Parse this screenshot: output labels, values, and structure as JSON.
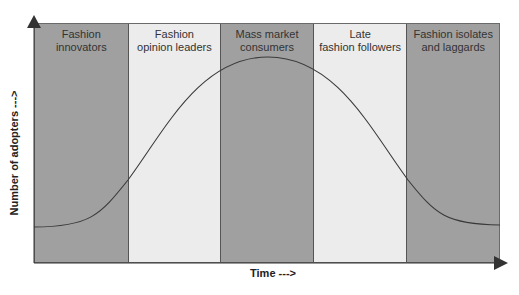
{
  "diagram": {
    "y_axis_label": "Number of adopters --->",
    "x_axis_label": "Time --->",
    "segments": [
      {
        "label": "Fashion\ninnovators",
        "color": "#a0a0a0",
        "width": 94
      },
      {
        "label": "Fashion\nopinion leaders",
        "color": "#ececec",
        "width": 93
      },
      {
        "label": "Mass market\nconsumers",
        "color": "#a0a0a0",
        "width": 93
      },
      {
        "label": "Late\nfashion followers",
        "color": "#ececec",
        "width": 94
      },
      {
        "label": "Fashion isolates\nand laggards",
        "color": "#a0a0a0",
        "width": 92
      }
    ],
    "curve_color": "#3a3a3a",
    "axis_color": "#333333"
  }
}
